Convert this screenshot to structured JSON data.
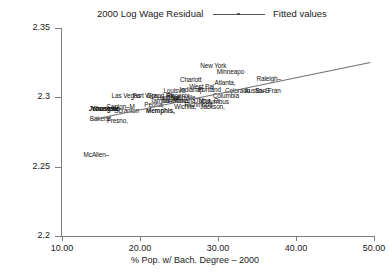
{
  "header": {
    "title": "2000 Log Wage Residual",
    "legend": {
      "label": "Fitted values",
      "icon": "fitted-line-marker"
    }
  },
  "axes": {
    "x_title": "% Pop. w/ Bach. Degree – 2000",
    "x_ticks": [
      "10.00",
      "20.00",
      "30.00",
      "40.00",
      "50.00"
    ],
    "y_ticks": [
      "2.35",
      "2.3",
      "2.25",
      "2.2"
    ]
  },
  "chart_data": {
    "type": "scatter",
    "title": "2000 Log Wage Residual",
    "xlabel": "% Pop. w/ Bach. Degree – 2000",
    "ylabel": "",
    "xlim": [
      10.0,
      50.0
    ],
    "ylim": [
      2.2,
      2.35
    ],
    "xticks": [
      10.0,
      20.0,
      30.0,
      40.0,
      50.0
    ],
    "yticks": [
      2.35,
      2.3,
      2.25,
      2.2
    ],
    "grid": false,
    "legend": [
      "Fitted values"
    ],
    "legend_position": "top-right",
    "series": [
      {
        "name": "Metro areas",
        "marker": "text-label",
        "points": [
          {
            "label": "New York",
            "x": 29.4,
            "y": 2.323
          },
          {
            "label": "Minneapo",
            "x": 31.6,
            "y": 2.319
          },
          {
            "label": "Charlott",
            "x": 26.5,
            "y": 2.313
          },
          {
            "label": "Atlanta,",
            "x": 30.9,
            "y": 2.311
          },
          {
            "label": "Raleigh–",
            "x": 36.5,
            "y": 2.314
          },
          {
            "label": "West Pal",
            "x": 27.9,
            "y": 2.308
          },
          {
            "label": "Austin–S",
            "x": 35.0,
            "y": 2.305
          },
          {
            "label": "San Fran",
            "x": 36.4,
            "y": 2.305
          },
          {
            "label": "Indianap",
            "x": 26.6,
            "y": 2.306
          },
          {
            "label": "Portland",
            "x": 28.9,
            "y": 2.306
          },
          {
            "label": "Colorado",
            "x": 32.5,
            "y": 2.305
          },
          {
            "label": "Louisvill",
            "x": 24.4,
            "y": 2.305
          },
          {
            "label": "Las Vegas",
            "x": 18.2,
            "y": 2.302
          },
          {
            "label": "Fort Wor",
            "x": 20.6,
            "y": 2.302
          },
          {
            "label": "Grand Ra",
            "x": 22.6,
            "y": 2.302
          },
          {
            "label": "Phoenix,",
            "x": 25.0,
            "y": 2.302
          },
          {
            "label": "Columbia",
            "x": 31.0,
            "y": 2.302
          },
          {
            "label": "Nashville",
            "x": 25.5,
            "y": 2.3
          },
          {
            "label": "Hartford",
            "x": 23.6,
            "y": 2.3
          },
          {
            "label": "Tampa–St",
            "x": 23.1,
            "y": 2.298
          },
          {
            "label": "Milwauke",
            "x": 24.5,
            "y": 2.298
          },
          {
            "label": "Omaha, N",
            "x": 26.3,
            "y": 2.298
          },
          {
            "label": "Tulsa, O",
            "x": 28.6,
            "y": 2.298
          },
          {
            "label": "Columbus",
            "x": 29.6,
            "y": 2.297
          },
          {
            "label": "Peoria,",
            "x": 21.8,
            "y": 2.295
          },
          {
            "label": "Richmond",
            "x": 27.5,
            "y": 2.295
          },
          {
            "label": "Jackson,",
            "x": 29.3,
            "y": 2.294
          },
          {
            "label": "Wichita,",
            "x": 25.8,
            "y": 2.294
          },
          {
            "label": "Canton–M",
            "x": 17.5,
            "y": 2.294
          },
          {
            "label": "Scranton",
            "x": 18.3,
            "y": 2.291
          },
          {
            "label": "Memphis,",
            "x": 22.6,
            "y": 2.291
          },
          {
            "label": "Youngsto",
            "x": 15.6,
            "y": 2.292
          },
          {
            "label": "Johnstow",
            "x": 15.3,
            "y": 2.292
          },
          {
            "label": "Bakersf",
            "x": 14.9,
            "y": 2.285
          },
          {
            "label": "Fresno,",
            "x": 17.1,
            "y": 2.284
          },
          {
            "label": "McAllen–",
            "x": 14.4,
            "y": 2.259
          }
        ]
      },
      {
        "name": "Fitted values",
        "type": "line",
        "x": [
          14.0,
          49.5
        ],
        "y": [
          2.2845,
          2.3255
        ]
      }
    ]
  }
}
